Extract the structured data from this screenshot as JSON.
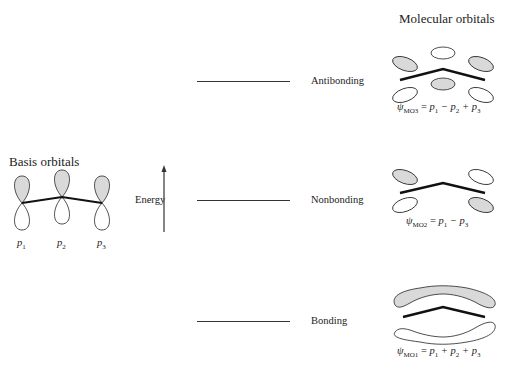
{
  "titles": {
    "molecular_orbitals": "Molecular orbitals",
    "basis_orbitals": "Basis orbitals"
  },
  "axis": {
    "label": "Energy"
  },
  "levels": [
    {
      "name": "Antibonding",
      "y": 81
    },
    {
      "name": "Nonbonding",
      "y": 200
    },
    {
      "name": "Bonding",
      "y": 321
    }
  ],
  "basis": {
    "labels": [
      "p1",
      "p2",
      "p3"
    ],
    "label_main": "p",
    "label_subs": [
      "1",
      "2",
      "3"
    ]
  },
  "molecular_orbitals": [
    {
      "id": "MO3",
      "psi": "ψ",
      "sub": "MO",
      "sub_num": "3",
      "rhs": "= p1 − p2 + p3",
      "terms": [
        "p",
        "1",
        " − p",
        "2",
        " + p",
        "3"
      ]
    },
    {
      "id": "MO2",
      "psi": "ψ",
      "sub": "MO",
      "sub_num": "2",
      "rhs": "= p1 − p3",
      "terms": [
        "p",
        "1",
        " − p",
        "3"
      ]
    },
    {
      "id": "MO1",
      "psi": "ψ",
      "sub": "MO",
      "sub_num": "1",
      "rhs": "= p1 + p2 + p3",
      "terms": [
        "p",
        "1",
        " + p",
        "2",
        " + p",
        "3"
      ]
    }
  ],
  "colors": {
    "shaded_lobe": "#d9d9d9",
    "line": "#111111",
    "background": "#ffffff"
  }
}
